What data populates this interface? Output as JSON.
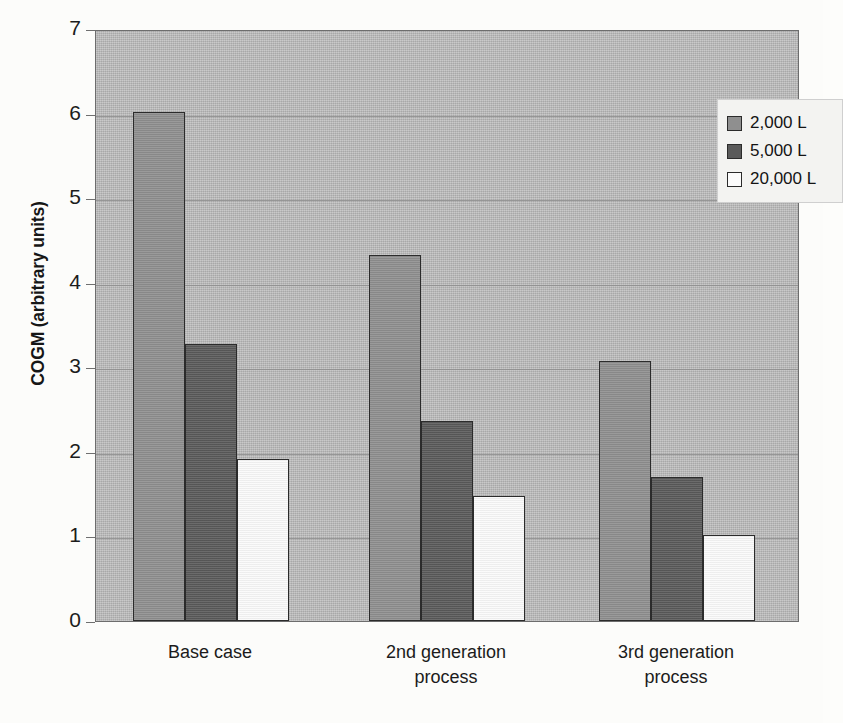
{
  "chart_data": {
    "type": "bar",
    "title": "",
    "xlabel": "",
    "ylabel": "COGM (arbitrary units)",
    "categories": [
      "Base case",
      "2nd generation process",
      "3rd generation process"
    ],
    "category_lines": [
      [
        "Base case"
      ],
      [
        "2nd generation",
        "process"
      ],
      [
        "3rd generation",
        "process"
      ]
    ],
    "series": [
      {
        "name": "2,000 L",
        "color": "#8f8f8f",
        "values": [
          6.02,
          4.33,
          3.07
        ]
      },
      {
        "name": "5,000 L",
        "color": "#5a5a5a",
        "values": [
          3.27,
          2.37,
          1.7
        ]
      },
      {
        "name": "20,000 L",
        "color": "#fafafa",
        "values": [
          1.92,
          1.48,
          1.02
        ]
      }
    ],
    "ylim": [
      0,
      7
    ],
    "yticks": [
      0,
      1,
      2,
      3,
      4,
      5,
      6,
      7
    ],
    "ytick_labels": [
      "0",
      "1",
      "2",
      "3",
      "4",
      "5",
      "6",
      "7"
    ],
    "grid": true,
    "grid_axis": "y",
    "legend_position": "top-right",
    "plot_background": "#b9b9b9",
    "bar_border_color": "#2b2b2b"
  }
}
